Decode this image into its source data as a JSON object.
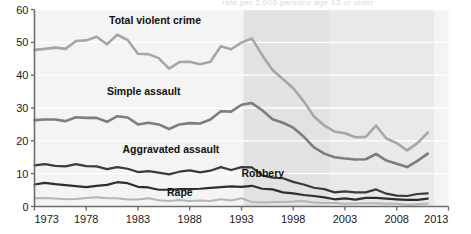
{
  "chart_data": {
    "type": "line",
    "title": "",
    "xlabel": "",
    "ylabel": "",
    "xlim": [
      1973,
      2013
    ],
    "ylim": [
      0,
      60
    ],
    "grid": true,
    "grid_axis": "y",
    "legend": "inline-labels",
    "y_ticks": [
      0,
      10,
      20,
      30,
      40,
      50,
      60
    ],
    "x_ticks": [
      1973,
      1978,
      1983,
      1988,
      1993,
      1998,
      2003,
      2008,
      2013
    ],
    "x": [
      1973,
      1974,
      1975,
      1976,
      1977,
      1978,
      1979,
      1980,
      1981,
      1982,
      1983,
      1984,
      1985,
      1986,
      1987,
      1988,
      1989,
      1990,
      1991,
      1992,
      1993,
      1994,
      1995,
      1996,
      1997,
      1998,
      1999,
      2000,
      2001,
      2002,
      2003,
      2004,
      2005,
      2006,
      2007,
      2008,
      2009,
      2010,
      2011
    ],
    "series": [
      {
        "name": "Total violent crime",
        "color": "#a6a6a6",
        "width": 2.6,
        "label_x": 1980.2,
        "label_y": 55.5,
        "values": [
          47.7,
          48.0,
          48.4,
          48.0,
          50.4,
          50.6,
          51.7,
          49.4,
          52.3,
          50.7,
          46.5,
          46.4,
          45.2,
          42.0,
          44.0,
          44.1,
          43.3,
          44.1,
          48.8,
          47.9,
          49.9,
          51.2,
          46.1,
          41.6,
          38.8,
          36.0,
          32.1,
          27.4,
          24.7,
          22.8,
          22.3,
          21.1,
          21.2,
          24.6,
          20.7,
          19.3,
          17.1,
          19.3,
          22.5
        ]
      },
      {
        "name": "Simple assault",
        "color": "#7d7d7d",
        "width": 2.6,
        "label_x": 1980.0,
        "label_y": 34.0,
        "values": [
          26.3,
          26.5,
          26.5,
          26.0,
          27.2,
          27.0,
          27.0,
          25.8,
          27.5,
          27.1,
          25.0,
          25.5,
          25.0,
          23.6,
          25.0,
          25.4,
          25.3,
          26.5,
          29.0,
          28.9,
          31.0,
          31.5,
          29.3,
          26.6,
          25.5,
          24.0,
          21.3,
          18.0,
          16.1,
          15.0,
          14.6,
          14.3,
          14.4,
          16.0,
          14.0,
          13.0,
          12.0,
          13.9,
          16.1
        ]
      },
      {
        "name": "Aggravated assault",
        "color": "#3a3a3a",
        "width": 2.2,
        "label_x": 1981.5,
        "label_y": 16.2,
        "values": [
          12.5,
          12.9,
          12.4,
          12.2,
          12.9,
          12.3,
          12.2,
          11.4,
          12.0,
          11.5,
          10.5,
          10.8,
          10.3,
          9.8,
          10.6,
          11.0,
          10.4,
          10.9,
          12.0,
          11.1,
          12.0,
          11.9,
          9.5,
          8.8,
          8.6,
          7.5,
          6.7,
          5.7,
          5.3,
          4.3,
          4.6,
          4.3,
          4.3,
          5.2,
          3.9,
          3.3,
          3.2,
          3.8,
          4.0
        ]
      },
      {
        "name": "Robbery",
        "color": "#2e2e2e",
        "width": 2.2,
        "label_x": 1993.0,
        "label_y": 8.9,
        "values": [
          6.7,
          7.2,
          6.8,
          6.5,
          6.2,
          5.9,
          6.3,
          6.6,
          7.4,
          7.1,
          6.0,
          5.8,
          5.1,
          5.1,
          5.3,
          5.3,
          5.4,
          5.7,
          5.9,
          6.1,
          6.0,
          6.3,
          5.4,
          5.2,
          4.3,
          4.0,
          3.5,
          3.2,
          2.8,
          2.2,
          2.5,
          2.1,
          2.6,
          2.6,
          2.4,
          2.2,
          2.0,
          2.0,
          2.4
        ]
      },
      {
        "name": "Rape",
        "color": "#b5b5b5",
        "width": 2.0,
        "label_x": 1985.8,
        "label_y": 3.2,
        "values": [
          2.5,
          2.6,
          2.4,
          2.2,
          2.3,
          2.6,
          2.8,
          2.5,
          2.5,
          2.1,
          2.1,
          2.5,
          1.9,
          1.7,
          2.0,
          1.7,
          1.8,
          1.7,
          2.2,
          1.8,
          2.5,
          1.4,
          1.2,
          1.4,
          1.4,
          1.5,
          1.7,
          1.2,
          1.1,
          1.1,
          0.8,
          0.9,
          1.0,
          1.0,
          0.8,
          0.8,
          0.5,
          0.7,
          0.9
        ]
      }
    ],
    "shaded_bands": [
      {
        "name": "band-mid",
        "x0": 1993.2,
        "x1": 2001.5,
        "color": "#e2e2e2"
      },
      {
        "name": "band-right",
        "x0": 2001.5,
        "x1": 2011.6,
        "color": "#e9e9e9"
      }
    ],
    "plot_bg": "#f4f4f4",
    "axis_color": "#6e6e6e",
    "gridline_color": "#ffffff"
  },
  "clipped_header": {
    "text": "rate per 1,000 persons age 12 or older"
  }
}
